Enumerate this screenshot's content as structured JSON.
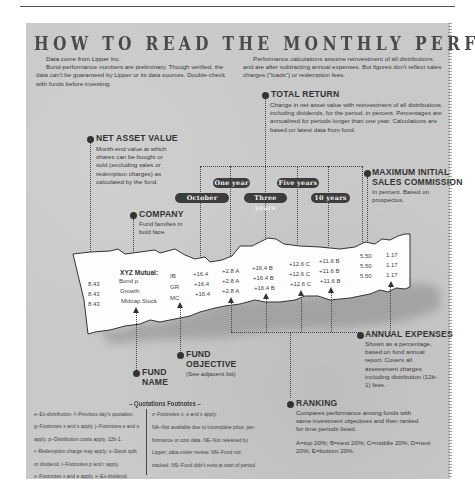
{
  "title": "HOW TO READ THE MONTHLY PERFORMANCE TABLES",
  "intro_left": {
    "lead": "Data come from Lipper Inc.",
    "body": "Bond-performance numbers are preliminary. Though verified, the data can't be guaranteed by Lipper or its data sources. Double-check with funds before investing."
  },
  "intro_right": {
    "body": "Performance calculations assume reinvestment of all distributions, and are after subtracting annual expenses. But figures don't reflect sales charges (\"loads\") or redemption fees."
  },
  "callouts": {
    "total_return": {
      "heading": "TOTAL RETURN",
      "body": "Change in net asset value with reinvestment of all distributions, including dividends, for the period, in percent. Percentages are annualized for periods longer than one year. Calculations are based on latest data from fund."
    },
    "net_asset_value": {
      "heading": "NET ASSET VALUE",
      "body": "Month-end value at which shares can be bought or sold (excluding sales or redemption charges) as calculated by the fund."
    },
    "company": {
      "heading": "COMPANY",
      "body": "Fund families in bold face."
    },
    "max_sales_commission": {
      "heading_line1": "MAXIMUM INITIAL",
      "heading_line2": "SALES COMMISSION",
      "body": "In percent. Based on prospectus."
    },
    "annual_expenses": {
      "heading": "ANNUAL EXPENSES",
      "body": "Shown as a percentage, based on fund annual report. Covers all assessment charges including distribution (12b-1) fees."
    },
    "fund_objective": {
      "heading_line1": "FUND",
      "heading_line2": "OBJECTIVE",
      "body": "(See adjacent list)"
    },
    "fund_name": {
      "heading_line1": "FUND",
      "heading_line2": "NAME"
    },
    "ranking": {
      "heading": "RANKING",
      "body": "Compares performance among funds with same investment objectives and then ranked for time periods listed.",
      "scale": "A=top 20%; B=next 20%; C=middle 20%; D=next 20%; E=bottom 20%."
    }
  },
  "period_labels": {
    "october": "October",
    "one_year": "One year",
    "three_years": "Three years",
    "five_years": "Five years",
    "ten_years": "10 years"
  },
  "sample_table": {
    "company": "XYZ Mutual:",
    "rows": [
      {
        "nav": "8.43",
        "fund": "Bond p",
        "objective": "IB",
        "october": "+16.4",
        "one_year": "+2.8 A",
        "three_years": "+16.4 B",
        "five_years": "+12.6 C",
        "ten_years": "+11.6 B",
        "max_commission": "5.50",
        "expenses": "1.17"
      },
      {
        "nav": "8.43",
        "fund": "Growth",
        "objective": "GR",
        "october": "+16.4",
        "one_year": "+2.8 A",
        "three_years": "+16.4 B",
        "five_years": "+12.6 C",
        "ten_years": "+11.6 B",
        "max_commission": "5.50",
        "expenses": "1.17"
      },
      {
        "nav": "8.43",
        "fund": "Midcap Stock",
        "objective": "MC",
        "october": "+16.4",
        "one_year": "+2.8 A",
        "three_years": "+16.4 B",
        "five_years": "+12.6 C",
        "ten_years": "+11.6 B",
        "max_commission": "5.50",
        "expenses": "1.17"
      }
    ]
  },
  "footnotes": {
    "title": "– Quotations Footnotes –",
    "left": [
      "e–Ex-distribution. f–Previous day's quotation.",
      "g–Footnotes x and s apply. j–Footnotes e and s",
      "apply. p–Distribution costs apply, 12b-1.",
      "r–Redemption charge may apply. s–Stock split",
      "or dividend. t–Footnotes p and r apply.",
      "v–Footnotes x and e apply. x–Ex-dividend."
    ],
    "right": [
      "z–Footnotes x, e and s apply.",
      "NA–Not available due to incomplete price, per-",
      "formance or cost data. NE–Not released by",
      "Lipper; data under review. NN–Fund not",
      "tracked. NS–Fund didn't exist at start of period."
    ]
  }
}
